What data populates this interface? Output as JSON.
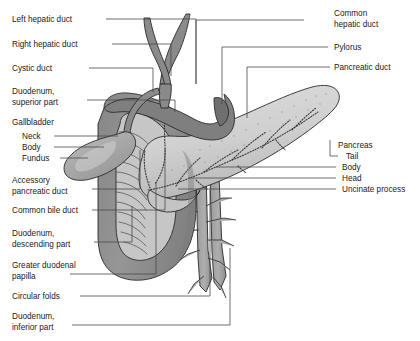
{
  "figure": {
    "background_color": "#ffffff",
    "line_color": "#4a4a4a",
    "text_color": "#1a1a1a"
  },
  "palette": {
    "duodenum_dark": "#8e8e8e",
    "duodenum_mid": "#9c9c9c",
    "pancreas_light": "#d2d2d2",
    "pancreas_shadow": "#bdbdbd",
    "gallbladder": "#a8a8a8",
    "gallbladder_highlight": "#c4c4c4",
    "duct_gray": "#8a8a8a",
    "mucosa": "#c9c9c9",
    "vessel": "#a0a0a0",
    "outline": "#2b2b2b"
  },
  "labels_left": [
    {
      "id": "left-hepatic-duct",
      "lines": [
        "Left hepatic duct"
      ],
      "x": 12,
      "y": 22
    },
    {
      "id": "right-hepatic-duct",
      "lines": [
        "Right hepatic duct"
      ],
      "x": 12,
      "y": 47
    },
    {
      "id": "cystic-duct",
      "lines": [
        "Cystic duct"
      ],
      "x": 12,
      "y": 71
    },
    {
      "id": "duodenum-superior-part",
      "lines": [
        "Duodenum,",
        "superior part"
      ],
      "x": 12,
      "y": 94
    },
    {
      "id": "gallbladder",
      "lines": [
        "Gallbladder"
      ],
      "x": 12,
      "y": 125
    },
    {
      "id": "gallbladder-neck",
      "lines": [
        "Neck"
      ],
      "x": 22,
      "y": 139
    },
    {
      "id": "gallbladder-body",
      "lines": [
        "Body"
      ],
      "x": 22,
      "y": 150
    },
    {
      "id": "gallbladder-fundus",
      "lines": [
        "Fundus"
      ],
      "x": 22,
      "y": 161
    },
    {
      "id": "accessory-pancreatic-duct",
      "lines": [
        "Accessory",
        "pancreatic duct"
      ],
      "x": 12,
      "y": 183
    },
    {
      "id": "common-bile-duct",
      "lines": [
        "Common bile duct"
      ],
      "x": 12,
      "y": 213
    },
    {
      "id": "duodenum-descending-part",
      "lines": [
        "Duodenum,",
        "descending part"
      ],
      "x": 12,
      "y": 236
    },
    {
      "id": "greater-duodenal-papilla",
      "lines": [
        "Greater duodenal",
        "papilla"
      ],
      "x": 12,
      "y": 268
    },
    {
      "id": "circular-folds",
      "lines": [
        "Circular folds"
      ],
      "x": 12,
      "y": 299
    },
    {
      "id": "duodenum-inferior-part",
      "lines": [
        "Duodenum,",
        "inferior part"
      ],
      "x": 12,
      "y": 319
    }
  ],
  "labels_right": [
    {
      "id": "common-hepatic-duct",
      "lines": [
        "Common",
        "hepatic duct"
      ],
      "x": 334,
      "y": 16
    },
    {
      "id": "pylorus",
      "lines": [
        "Pylorus"
      ],
      "x": 334,
      "y": 50
    },
    {
      "id": "pancreatic-duct",
      "lines": [
        "Pancreatic duct"
      ],
      "x": 334,
      "y": 70
    },
    {
      "id": "pancreas",
      "lines": [
        "Pancreas"
      ],
      "x": 338,
      "y": 148
    },
    {
      "id": "pancreas-tail",
      "lines": [
        "Tail"
      ],
      "x": 346,
      "y": 159
    },
    {
      "id": "pancreas-body",
      "lines": [
        "Body"
      ],
      "x": 342,
      "y": 170
    },
    {
      "id": "pancreas-head",
      "lines": [
        "Head"
      ],
      "x": 342,
      "y": 181
    },
    {
      "id": "uncinate-process",
      "lines": [
        "Uncinate process"
      ],
      "x": 342,
      "y": 192
    }
  ],
  "leaders": [
    {
      "id": "leader-left-hepatic-duct",
      "d": "M 106 19 L 196 19 L 196 84"
    },
    {
      "id": "leader-right-hepatic-duct",
      "d": "M 112 44 L 171 44 L 171 76"
    },
    {
      "id": "leader-cystic-duct",
      "d": "M 89 68 L 153 68 L 153 92"
    },
    {
      "id": "leader-duodenum-superior",
      "d": "M 87 100 L 175 100 L 175 112"
    },
    {
      "id": "leader-gallbladder-neck",
      "d": "M 54 136 L 118 136"
    },
    {
      "id": "leader-gallbladder-body",
      "d": "M 54 147 L 104 147"
    },
    {
      "id": "leader-gallbladder-fundus",
      "d": "M 60 158 L 88 158"
    },
    {
      "id": "leader-accessory-pancreatic-duct",
      "d": "M 92 189 L 140 189 L 140 150"
    },
    {
      "id": "leader-common-bile-duct",
      "d": "M 92 210 L 165 210 L 165 148"
    },
    {
      "id": "leader-duodenum-descending",
      "d": "M 94 242 L 132 242 L 132 206"
    },
    {
      "id": "leader-greater-duodenal-papilla",
      "d": "M 70 274 L 156 274 L 156 182"
    },
    {
      "id": "leader-circular-folds",
      "d": "M 80 296 L 210 296 L 210 190"
    },
    {
      "id": "leader-duodenum-inferior",
      "d": "M 72 325 L 230 325 L 230 248"
    },
    {
      "id": "leader-common-hepatic-duct",
      "d": "M 304 20 L 196 20 L 196 84"
    },
    {
      "id": "leader-pylorus",
      "d": "M 328 47 L 222 47 L 222 104"
    },
    {
      "id": "leader-pancreatic-duct",
      "d": "M 330 67 L 247 67 L 247 118"
    },
    {
      "id": "leader-pancreas-tail",
      "d": "M 338 156 L 330 156 L 330 140"
    },
    {
      "id": "leader-pancreas-body",
      "d": "M 336 167 L 216 167"
    },
    {
      "id": "leader-pancreas-head",
      "d": "M 336 178 L 188 178"
    },
    {
      "id": "leader-uncinate-process",
      "d": "M 336 189 L 178 189"
    }
  ],
  "pancreas_ducts": [
    {
      "id": "main-pancreatic-duct",
      "d": "M 148 190 C 176 186 204 172 232 160 C 262 148 292 130 318 112"
    },
    {
      "id": "duct-branch-a",
      "d": "M 176 186 C 182 176 190 166 200 158"
    },
    {
      "id": "duct-branch-b",
      "d": "M 204 172 C 214 164 226 156 238 150"
    },
    {
      "id": "duct-branch-c",
      "d": "M 232 160 C 242 150 254 140 266 132"
    },
    {
      "id": "duct-branch-d",
      "d": "M 262 148 C 270 138 280 128 290 120"
    },
    {
      "id": "duct-branch-e",
      "d": "M 292 130 C 300 122 308 114 316 108"
    },
    {
      "id": "duct-branch-f",
      "d": "M 196 180 C 204 188 214 194 224 198"
    },
    {
      "id": "duct-branch-g",
      "d": "M 238 166 C 246 174 256 180 266 184"
    },
    {
      "id": "accessory-duct-path",
      "d": "M 148 190 C 144 178 142 166 144 152"
    },
    {
      "id": "common-bile-duct-path",
      "d": "M 164 88 C 164 106 163 126 164 146 C 165 160 162 172 156 182"
    },
    {
      "id": "head-duct-loop",
      "d": "M 156 182 C 150 192 148 202 150 212"
    }
  ],
  "stats": {
    "width": 420,
    "height": 341
  }
}
